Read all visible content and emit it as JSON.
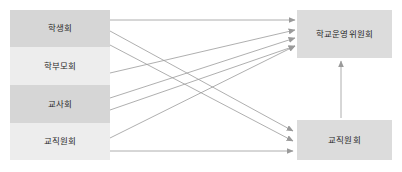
{
  "diagram": {
    "title_present": false,
    "background_color": "#ffffff",
    "left_nodes": [
      {
        "id": "student-council",
        "label": "학생회",
        "fill": "#d6d6d6",
        "x": 10,
        "y": 10,
        "w": 100,
        "h": 37
      },
      {
        "id": "parents-association",
        "label": "학부모회",
        "fill": "#ededed",
        "x": 10,
        "y": 47,
        "w": 100,
        "h": 38
      },
      {
        "id": "teachers-association",
        "label": "교사회",
        "fill": "#d6d6d6",
        "x": 10,
        "y": 85,
        "w": 100,
        "h": 38
      },
      {
        "id": "staff-association-left",
        "label": "교직원회",
        "fill": "#ededed",
        "x": 10,
        "y": 123,
        "w": 100,
        "h": 37
      }
    ],
    "right_nodes": [
      {
        "id": "school-steering-committee",
        "label": "학교운영위원회",
        "fill": "#dcdcdc",
        "x": 297,
        "y": 10,
        "w": 95,
        "h": 48
      },
      {
        "id": "staff-association-right",
        "label": "교직원회",
        "fill": "#dcdcdc",
        "x": 297,
        "y": 120,
        "w": 95,
        "h": 40
      }
    ],
    "edge_color": "#9a9a9a",
    "edges": [
      {
        "id": "edge-student-to-committee",
        "from": "student-council",
        "to": "school-steering-committee",
        "x1": 110,
        "y1": 20,
        "x2": 295,
        "y2": 20
      },
      {
        "id": "edge-student-to-staff",
        "from": "student-council",
        "to": "staff-association-right",
        "x1": 110,
        "y1": 31,
        "x2": 293,
        "y2": 131
      },
      {
        "id": "edge-parents-to-staff",
        "from": "parents-association",
        "to": "staff-association-right",
        "x1": 110,
        "y1": 45,
        "x2": 293,
        "y2": 141
      },
      {
        "id": "edge-parents-to-committee",
        "from": "parents-association",
        "to": "school-steering-committee",
        "x1": 110,
        "y1": 73,
        "x2": 295,
        "y2": 30
      },
      {
        "id": "edge-teachers-to-committee",
        "from": "teachers-association",
        "to": "school-steering-committee",
        "x1": 110,
        "y1": 98,
        "x2": 295,
        "y2": 38
      },
      {
        "id": "edge-teachers-to-committee-2",
        "from": "teachers-association",
        "to": "school-steering-committee",
        "x1": 110,
        "y1": 110,
        "x2": 295,
        "y2": 46
      },
      {
        "id": "edge-staff-left-to-committee",
        "from": "staff-association-left",
        "to": "school-steering-committee",
        "x1": 110,
        "y1": 138,
        "x2": 295,
        "y2": 46
      },
      {
        "id": "edge-staff-left-to-staff-right",
        "from": "staff-association-left",
        "to": "staff-association-right",
        "x1": 110,
        "y1": 151,
        "x2": 293,
        "y2": 151
      },
      {
        "id": "edge-staff-right-to-committee",
        "from": "staff-association-right",
        "to": "school-steering-committee",
        "x1": 341,
        "y1": 118,
        "x2": 341,
        "y2": 61
      }
    ]
  }
}
